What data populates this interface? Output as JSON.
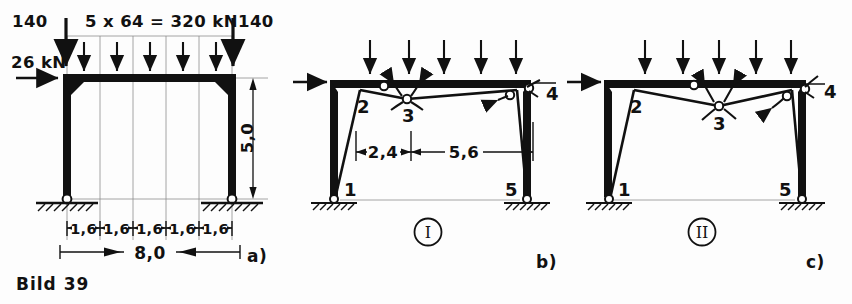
{
  "figure": {
    "caption": "Bild 39",
    "panels": [
      {
        "key": "a",
        "label": "a)",
        "title_omitted": "",
        "loads": {
          "top_distributed_label": "5 x 64 = 320 kN",
          "left_point_load": "140",
          "right_point_load": "140",
          "horizontal_load": "26 kN",
          "arrow_count": 5
        },
        "dimensions": {
          "height": "5,0",
          "bays": [
            "1,6",
            "1,6",
            "1,6",
            "1,6",
            "1,6"
          ],
          "total_span": "8,0"
        }
      },
      {
        "key": "b",
        "label": "b)",
        "mechanism_id": "I",
        "joints": [
          "1",
          "2",
          "3",
          "4",
          "5"
        ],
        "dimensions": {
          "left": "2,4",
          "right": "5,6"
        },
        "arrow_count": 5
      },
      {
        "key": "c",
        "label": "c)",
        "mechanism_id": "II",
        "joints": [
          "1",
          "2",
          "3",
          "4",
          "5"
        ],
        "dimensions": {},
        "arrow_count": 5
      }
    ],
    "colors": {
      "ink": "#111111",
      "thin": "#4a4a4a",
      "paper": "#fdfdfd"
    }
  }
}
